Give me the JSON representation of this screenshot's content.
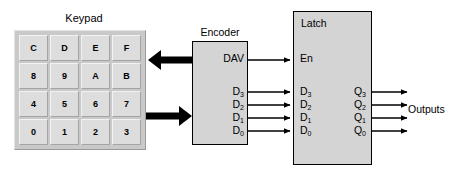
{
  "diagram": {
    "keypad": {
      "title": "Keypad",
      "keys": [
        [
          "C",
          "D",
          "E",
          "F"
        ],
        [
          "8",
          "9",
          "A",
          "B"
        ],
        [
          "4",
          "5",
          "6",
          "7"
        ],
        [
          "0",
          "1",
          "2",
          "3"
        ]
      ]
    },
    "encoder": {
      "caption": "Encoder",
      "outputs": {
        "dav": {
          "label": "DAV"
        },
        "data": [
          {
            "base": "D",
            "sub": "3"
          },
          {
            "base": "D",
            "sub": "2"
          },
          {
            "base": "D",
            "sub": "1"
          },
          {
            "base": "D",
            "sub": "0"
          }
        ]
      }
    },
    "latch": {
      "caption": "Latch",
      "inputs": {
        "enable": {
          "label": "En"
        },
        "data": [
          {
            "base": "D",
            "sub": "3"
          },
          {
            "base": "D",
            "sub": "2"
          },
          {
            "base": "D",
            "sub": "1"
          },
          {
            "base": "D",
            "sub": "0"
          }
        ]
      },
      "outputs": [
        {
          "base": "Q",
          "sub": "3"
        },
        {
          "base": "Q",
          "sub": "2"
        },
        {
          "base": "Q",
          "sub": "1"
        },
        {
          "base": "Q",
          "sub": "0"
        }
      ]
    },
    "outputs_label": "Outputs",
    "colors": {
      "block_fill": "#d4d4d4",
      "keypad_frame": "#c9c9c9",
      "key_face": "#dddddd",
      "line": "#000000",
      "background": "#ffffff"
    }
  }
}
